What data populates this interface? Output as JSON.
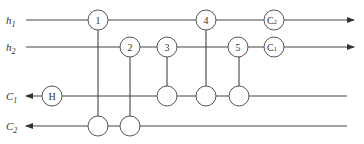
{
  "diagram": {
    "type": "circuit-network",
    "inputs": [
      {
        "id": "h1",
        "label": "h",
        "sub": "1",
        "y": 20
      },
      {
        "id": "h2",
        "label": "h",
        "sub": "2",
        "y": 47
      }
    ],
    "outputs_left": [
      {
        "id": "C1",
        "label": "C",
        "sub": "1",
        "y": 96
      },
      {
        "id": "C2",
        "label": "C",
        "sub": "2",
        "y": 126
      }
    ],
    "nodes": [
      {
        "id": "n1",
        "label": "1",
        "x": 98,
        "y": 20
      },
      {
        "id": "n2",
        "label": "2",
        "x": 130,
        "y": 47
      },
      {
        "id": "n3",
        "label": "3",
        "x": 167,
        "y": 47
      },
      {
        "id": "n4",
        "label": "4",
        "x": 206,
        "y": 20
      },
      {
        "id": "n5",
        "label": "5",
        "x": 238,
        "y": 47
      },
      {
        "id": "nC2",
        "label": "C",
        "sub": "2",
        "x": 274,
        "y": 20
      },
      {
        "id": "nC1",
        "label": "C",
        "sub": "1",
        "x": 274,
        "y": 47
      },
      {
        "id": "nH",
        "label": "H",
        "x": 52,
        "y": 96
      },
      {
        "id": "b3",
        "label": "",
        "x": 167,
        "y": 96
      },
      {
        "id": "b4",
        "label": "",
        "x": 206,
        "y": 96
      },
      {
        "id": "b5",
        "label": "",
        "x": 239,
        "y": 96
      },
      {
        "id": "b1",
        "label": "",
        "x": 98,
        "y": 126
      },
      {
        "id": "b2",
        "label": "",
        "x": 130,
        "y": 126
      }
    ],
    "connections": [
      {
        "from": "n1",
        "to": "b1"
      },
      {
        "from": "n2",
        "to": "b2"
      },
      {
        "from": "n3",
        "to": "b3"
      },
      {
        "from": "n4",
        "to": "b4"
      },
      {
        "from": "n5",
        "to": "b5"
      }
    ],
    "node_labels": {
      "n1": "1",
      "n2": "2",
      "n3": "3",
      "n4": "4",
      "n5": "5",
      "nH": "H",
      "nC2_main": "C",
      "nC2_sub": "2",
      "nC1_main": "C",
      "nC1_sub": "1"
    },
    "wire_labels": {
      "h1_main": "h",
      "h1_sub": "1",
      "h2_main": "h",
      "h2_sub": "2",
      "C1_main": "C",
      "C1_sub": "1",
      "C2_main": "C",
      "C2_sub": "2"
    }
  }
}
